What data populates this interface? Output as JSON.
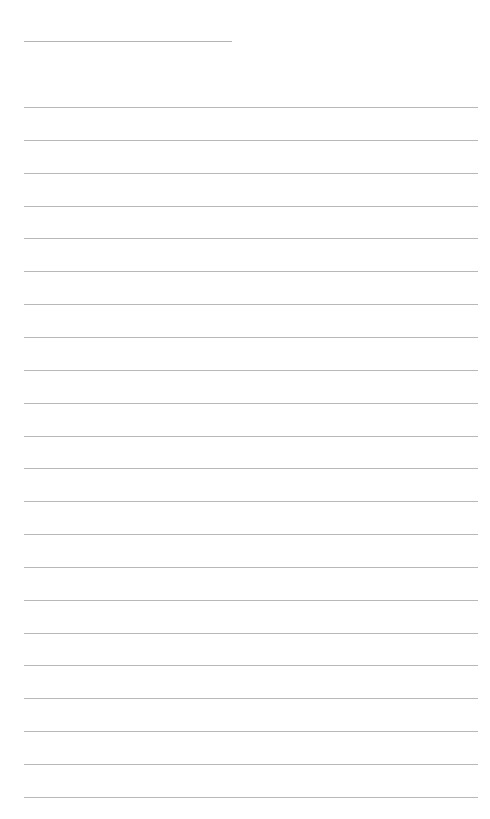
{
  "page": {
    "type": "blank-lined-page",
    "header_field": {
      "value": ""
    },
    "lines": [
      {
        "text": ""
      },
      {
        "text": ""
      },
      {
        "text": ""
      },
      {
        "text": ""
      },
      {
        "text": ""
      },
      {
        "text": ""
      },
      {
        "text": ""
      },
      {
        "text": ""
      },
      {
        "text": ""
      },
      {
        "text": ""
      },
      {
        "text": ""
      },
      {
        "text": ""
      },
      {
        "text": ""
      },
      {
        "text": ""
      },
      {
        "text": ""
      },
      {
        "text": ""
      },
      {
        "text": ""
      },
      {
        "text": ""
      },
      {
        "text": ""
      },
      {
        "text": ""
      },
      {
        "text": ""
      },
      {
        "text": ""
      }
    ],
    "colors": {
      "background": "#ffffff",
      "rule": "#b8b8b8"
    }
  }
}
